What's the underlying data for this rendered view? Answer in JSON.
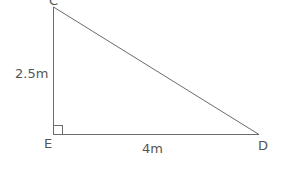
{
  "diagram": {
    "type": "right-triangle",
    "vertices": {
      "C": {
        "label": "C"
      },
      "E": {
        "label": "E"
      },
      "D": {
        "label": "D"
      }
    },
    "sides": {
      "CE": {
        "label": "2.5m"
      },
      "ED": {
        "label": "4m"
      }
    },
    "right_angle_at": "E",
    "stroke_color": "#6b6b6b"
  }
}
